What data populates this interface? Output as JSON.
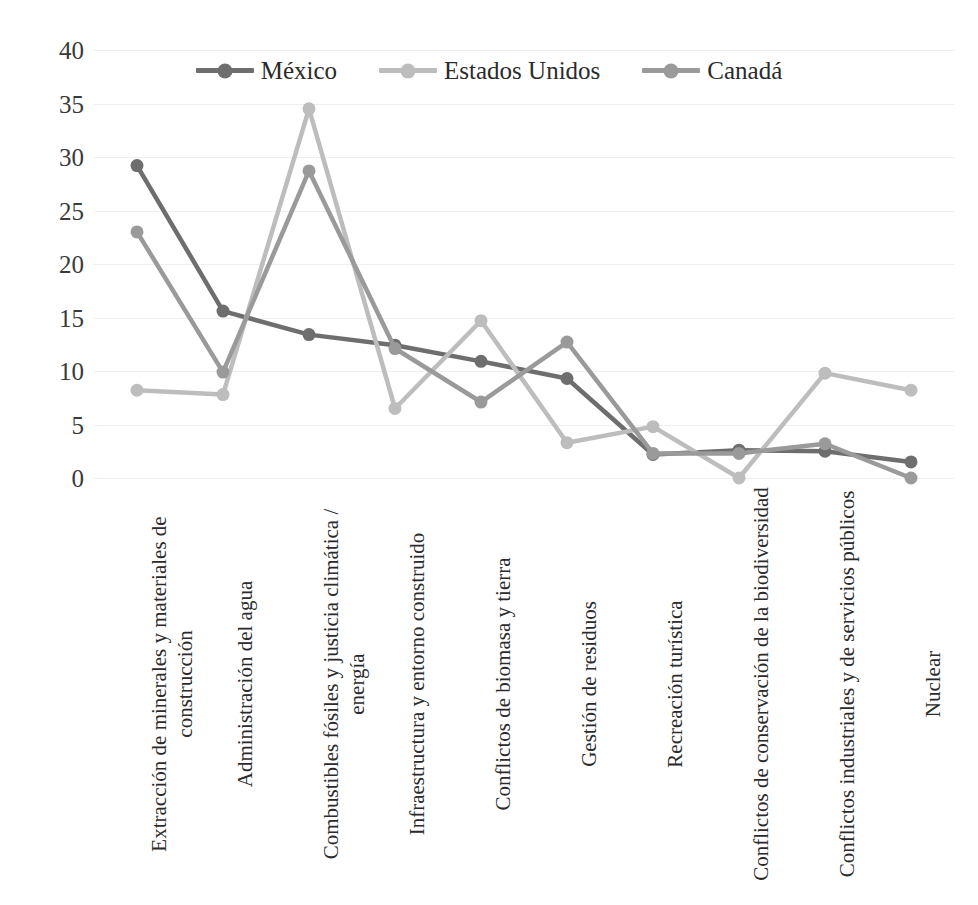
{
  "chart_data": {
    "type": "line",
    "title": "",
    "xlabel": "",
    "ylabel": "",
    "ylim": [
      0,
      40
    ],
    "ytick_values": [
      40,
      35,
      30,
      25,
      20,
      15,
      10,
      5,
      0
    ],
    "ytick_labels": [
      "40",
      "35",
      "30",
      "25",
      "20",
      "15",
      "10",
      "5",
      "0"
    ],
    "grid": true,
    "legend_position": "top-center",
    "categories": [
      "Extracción de minerales y materiales de construcción",
      "Administración del agua",
      "Combustibles fósiles y justicia climática / energía",
      "Infraestructura y entorno construido",
      "Conflictos de biomasa y tierra",
      "Gestión de residuos",
      "Recreación turística",
      "Conflictos de conservación de la biodiversidad",
      "Conflictos industriales y de servicios públicos",
      "Nuclear"
    ],
    "series": [
      {
        "name": "México",
        "color": "#6e6e6e",
        "values": [
          29.2,
          15.6,
          13.4,
          12.4,
          10.9,
          9.3,
          2.2,
          2.6,
          2.5,
          1.5
        ]
      },
      {
        "name": "Estados Unidos",
        "color": "#bdbdbd",
        "values": [
          8.2,
          7.8,
          34.5,
          6.5,
          14.7,
          3.3,
          4.8,
          0.0,
          9.8,
          8.2
        ]
      },
      {
        "name": "Canadá",
        "color": "#9a9a9a",
        "values": [
          23.0,
          9.9,
          28.7,
          12.1,
          7.1,
          12.7,
          2.3,
          2.3,
          3.2,
          0.0
        ]
      }
    ]
  },
  "legend": {
    "items": [
      {
        "label": "México"
      },
      {
        "label": "Estados Unidos"
      },
      {
        "label": "Canadá"
      }
    ]
  }
}
